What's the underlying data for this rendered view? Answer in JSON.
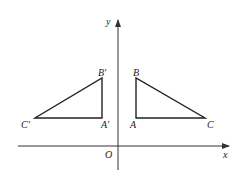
{
  "diagram": {
    "type": "coordinate-plane-reflection",
    "colors": {
      "line": "#222222",
      "axis": "#333333",
      "background": "#ffffff"
    },
    "axes": {
      "x_label": "x",
      "y_label": "y",
      "origin_label": "O"
    },
    "triangle_original": {
      "vertices": [
        {
          "name": "A",
          "label": "A"
        },
        {
          "name": "B",
          "label": "B"
        },
        {
          "name": "C",
          "label": "C"
        }
      ]
    },
    "triangle_reflected": {
      "vertices": [
        {
          "name": "A'",
          "label": "A′"
        },
        {
          "name": "B'",
          "label": "B′"
        },
        {
          "name": "C'",
          "label": "C′"
        }
      ]
    }
  }
}
